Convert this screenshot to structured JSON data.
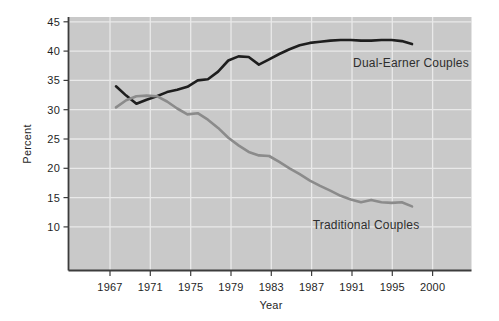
{
  "colors": {
    "page_background": "#ffffff",
    "plot_background": "#c9c9c9",
    "gridline": "#e9e9e9",
    "axis": "#3c3c3c",
    "text": "#1f1f1f",
    "dual_earner_line": "#1e1e1e",
    "traditional_line": "#8b8b8b"
  },
  "chart_data": {
    "type": "line",
    "title": "",
    "xlabel": "Year",
    "ylabel": "Percent",
    "grid": true,
    "legend_position": "inline-annotations",
    "x_tick_labels": [
      "1967",
      "1971",
      "1975",
      "1979",
      "1983",
      "1987",
      "1991",
      "1995",
      "2000"
    ],
    "y_ticks": [
      45,
      40,
      35,
      30,
      25,
      20,
      15,
      10
    ],
    "ylim_drawn": [
      2.5,
      46
    ],
    "x": [
      1968,
      1969,
      1970,
      1971,
      1972,
      1973,
      1974,
      1975,
      1976,
      1977,
      1978,
      1979,
      1980,
      1981,
      1982,
      1983,
      1984,
      1985,
      1986,
      1987,
      1988,
      1989,
      1990,
      1991,
      1992,
      1993,
      1994,
      1995,
      1996,
      1997
    ],
    "series": [
      {
        "name": "Dual-Earner Couples",
        "color": "#1e1e1e",
        "values": [
          34.0,
          32.4,
          31.0,
          31.7,
          32.3,
          33.0,
          33.4,
          33.9,
          35.0,
          35.2,
          36.5,
          38.4,
          39.1,
          39.0,
          37.7,
          38.6,
          39.5,
          40.3,
          41.0,
          41.4,
          41.6,
          41.8,
          41.9,
          41.9,
          41.8,
          41.8,
          41.9,
          41.9,
          41.7,
          41.2
        ]
      },
      {
        "name": "Traditional Couples",
        "color": "#8b8b8b",
        "values": [
          30.4,
          31.6,
          32.3,
          32.4,
          32.3,
          31.4,
          30.2,
          29.2,
          29.4,
          28.3,
          26.9,
          25.2,
          23.9,
          22.8,
          22.2,
          22.1,
          21.1,
          20.0,
          19.0,
          17.9,
          17.0,
          16.2,
          15.3,
          14.7,
          14.2,
          14.6,
          14.2,
          14.1,
          14.2,
          13.5
        ]
      }
    ],
    "annotations": [
      {
        "text": "Dual-Earner Couples",
        "x": 411,
        "y": 67,
        "align": "middle"
      },
      {
        "text": "Traditional Couples",
        "x": 366,
        "y": 229,
        "align": "middle"
      }
    ]
  }
}
